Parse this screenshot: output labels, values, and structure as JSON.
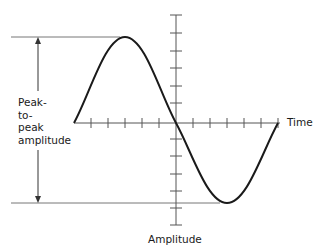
{
  "diagram": {
    "x_axis_label": "Time",
    "y_axis_label": "Amplitude",
    "annotation": {
      "lines": [
        "Peak-",
        "to-",
        "peak",
        "amplitude"
      ],
      "meaning": "Peak-to-peak amplitude"
    },
    "colors": {
      "curve": "#1a1a1a",
      "axes": "#555555",
      "reference_lines": "#777777",
      "text": "#1a1a1a"
    }
  }
}
